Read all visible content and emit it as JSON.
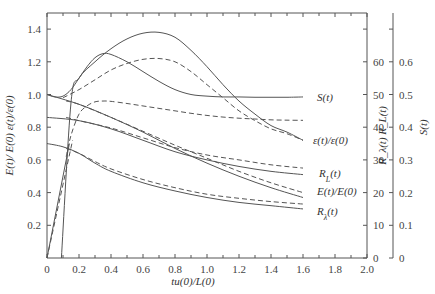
{
  "chart_data": {
    "type": "line",
    "title": "",
    "xlabel": "tu(0)/L(0)",
    "ylabel": "E(t)/ E(0) ε(t)/ε(0)",
    "ylabel_right_1": "R_λ(t) R_L(t)",
    "ylabel_right_2": "S(t)",
    "xlim": [
      0,
      2.0
    ],
    "ylim": [
      0,
      1.5
    ],
    "ylim_right_1": [
      0,
      75
    ],
    "ylim_right_2": [
      0,
      0.75
    ],
    "x_ticks": [
      "0",
      "0.2",
      "0.4",
      "0.6",
      "0.8",
      "1.0",
      "1.2",
      "1.4",
      "1.6",
      "1.8",
      "2.0"
    ],
    "y_ticks": [
      "0.2",
      "0.4",
      "0.6",
      "0.8",
      "1.0",
      "1.2",
      "1.4"
    ],
    "y_ticks_right_1": [
      "0",
      "10",
      "20",
      "30",
      "40",
      "50",
      "60"
    ],
    "y_ticks_right_2": [
      "0",
      "0.1",
      "0.2",
      "0.3",
      "0.4",
      "0.5",
      "0.6"
    ],
    "grid": false,
    "legend": "inline labels at right end of curves",
    "series": [
      {
        "name": "S(t)",
        "style": "solid",
        "label": "S(t)",
        "x": [
          0,
          0.05,
          0.1,
          0.15,
          0.2,
          0.25,
          0.3,
          0.35,
          0.4,
          0.5,
          0.6,
          0.7,
          0.8,
          0.9,
          1.0,
          1.1,
          1.2,
          1.3,
          1.4,
          1.5,
          1.6
        ],
        "y": [
          1.0,
          0.985,
          0.99,
          1.03,
          1.1,
          1.17,
          1.225,
          1.25,
          1.245,
          1.2,
          1.14,
          1.08,
          1.03,
          1.0,
          0.99,
          0.985,
          0.985,
          0.983,
          0.983,
          0.983,
          0.985
        ]
      },
      {
        "name": "S(t) model",
        "style": "dashed",
        "label": "",
        "x": [
          0.12,
          0.15,
          0.2,
          0.25,
          0.3,
          0.35,
          0.4,
          0.5,
          0.6,
          0.7,
          0.8,
          0.9,
          1.0,
          1.1,
          1.2,
          1.3,
          1.4,
          1.5,
          1.6
        ],
        "y": [
          0.62,
          0.75,
          0.88,
          0.93,
          0.955,
          0.96,
          0.958,
          0.945,
          0.93,
          0.915,
          0.9,
          0.885,
          0.872,
          0.862,
          0.855,
          0.85,
          0.845,
          0.843,
          0.842
        ]
      },
      {
        "name": "ε(t)/ε(0)",
        "style": "solid",
        "label": "ε(t)/ε(0)",
        "x": [
          0.09,
          0.15,
          0.2,
          0.3,
          0.4,
          0.5,
          0.6,
          0.7,
          0.8,
          0.9,
          1.0,
          1.1,
          1.2,
          1.3,
          1.4,
          1.5,
          1.6
        ],
        "y": [
          0.0,
          0.95,
          1.1,
          1.2,
          1.28,
          1.34,
          1.375,
          1.38,
          1.35,
          1.27,
          1.17,
          1.06,
          0.96,
          0.88,
          0.81,
          0.77,
          0.72
        ]
      },
      {
        "name": "ε(t)/ε(0) model",
        "style": "dashed",
        "label": "",
        "x": [
          0.1,
          0.2,
          0.3,
          0.4,
          0.5,
          0.6,
          0.7,
          0.8,
          0.9,
          1.0,
          1.1,
          1.2,
          1.3,
          1.4,
          1.5,
          1.6
        ],
        "y": [
          0.98,
          1.03,
          1.09,
          1.15,
          1.19,
          1.215,
          1.22,
          1.2,
          1.14,
          1.06,
          0.98,
          0.9,
          0.84,
          0.79,
          0.76,
          0.72
        ]
      },
      {
        "name": "R_L(t)",
        "style": "solid",
        "label": "R_L(t)",
        "x": [
          0,
          0.2,
          0.4,
          0.6,
          0.8,
          1.0,
          1.2,
          1.4,
          1.6
        ],
        "y": [
          0.86,
          0.84,
          0.79,
          0.72,
          0.65,
          0.6,
          0.56,
          0.53,
          0.51
        ]
      },
      {
        "name": "R_L(t) model",
        "style": "dashed",
        "label": "",
        "x": [
          0.12,
          0.2,
          0.4,
          0.6,
          0.8,
          1.0,
          1.2,
          1.4,
          1.6
        ],
        "y": [
          0.86,
          0.84,
          0.795,
          0.735,
          0.675,
          0.63,
          0.6,
          0.57,
          0.55
        ]
      },
      {
        "name": "E(t)/E(0)",
        "style": "solid",
        "label": "E(t)/E(0)",
        "x": [
          0,
          0.2,
          0.4,
          0.6,
          0.8,
          1.0,
          1.2,
          1.4,
          1.6
        ],
        "y": [
          1.0,
          0.94,
          0.86,
          0.77,
          0.67,
          0.58,
          0.5,
          0.43,
          0.37
        ]
      },
      {
        "name": "E(t)/E(0) model",
        "style": "dashed",
        "label": "",
        "x": [
          0.12,
          0.2,
          0.4,
          0.6,
          0.8,
          1.0,
          1.2,
          1.4,
          1.6
        ],
        "y": [
          0.96,
          0.94,
          0.86,
          0.775,
          0.69,
          0.61,
          0.53,
          0.46,
          0.4
        ]
      },
      {
        "name": "R_λ(t)",
        "style": "solid",
        "label": "R_λ(t)",
        "x": [
          0,
          0.1,
          0.2,
          0.3,
          0.4,
          0.6,
          0.8,
          1.0,
          1.2,
          1.4,
          1.6
        ],
        "y": [
          0.7,
          0.68,
          0.64,
          0.58,
          0.53,
          0.46,
          0.41,
          0.37,
          0.34,
          0.32,
          0.3
        ]
      },
      {
        "name": "R_λ(t) model",
        "style": "dashed",
        "label": "",
        "x": [
          0.12,
          0.2,
          0.3,
          0.4,
          0.6,
          0.8,
          1.0,
          1.2,
          1.4,
          1.6
        ],
        "y": [
          0.67,
          0.64,
          0.59,
          0.545,
          0.48,
          0.43,
          0.39,
          0.365,
          0.345,
          0.33
        ]
      },
      {
        "name": "initial ramp",
        "style": "solid",
        "label": "",
        "x": [
          0,
          0.14
        ],
        "y": [
          0,
          0.7
        ]
      },
      {
        "name": "initial ramp model",
        "style": "dashed",
        "label": "",
        "x": [
          0,
          0.16
        ],
        "y": [
          0,
          0.72
        ]
      }
    ]
  }
}
